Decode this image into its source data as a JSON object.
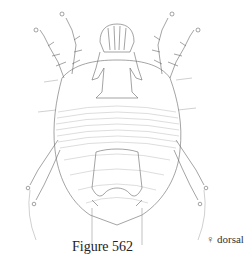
{
  "figure": {
    "caption": "Figure 562",
    "view_label": "♀ dorsal",
    "line_color": "#555555"
  }
}
